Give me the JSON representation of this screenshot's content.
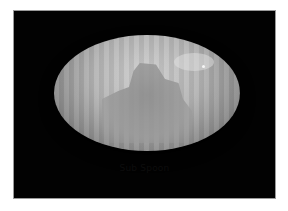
{
  "image": {
    "description": "Grayscale photo of a glossy ellipsoidal object with vertical stripe pattern against black background",
    "caption": "Sub Spoon"
  },
  "colors": {
    "background": "#ffffff",
    "frame": "#020202",
    "object_light": "#cfcfcf",
    "object_dark": "#5a5a5a"
  }
}
